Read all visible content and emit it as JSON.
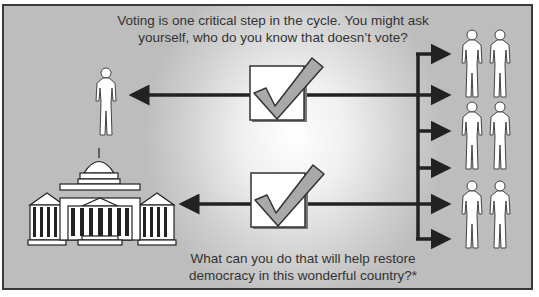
{
  "diagram": {
    "top_caption": "Voting is one critical step in the cycle. You might ask yourself, who do you know that doesn’t vote?",
    "bottom_caption": "What can you do that will help restore democracy in this wonderful country?*",
    "icons": {
      "checkbox": "checkmark-checkbox-icon",
      "person": "person-icon",
      "building": "capitol-building-icon"
    },
    "people_count_right": 6,
    "arrows_right": 6,
    "colors": {
      "background": "#c4c4c4",
      "arrow": "#222222",
      "check_fill": "#a9a9a9",
      "frame": "#3a3a3a"
    }
  }
}
